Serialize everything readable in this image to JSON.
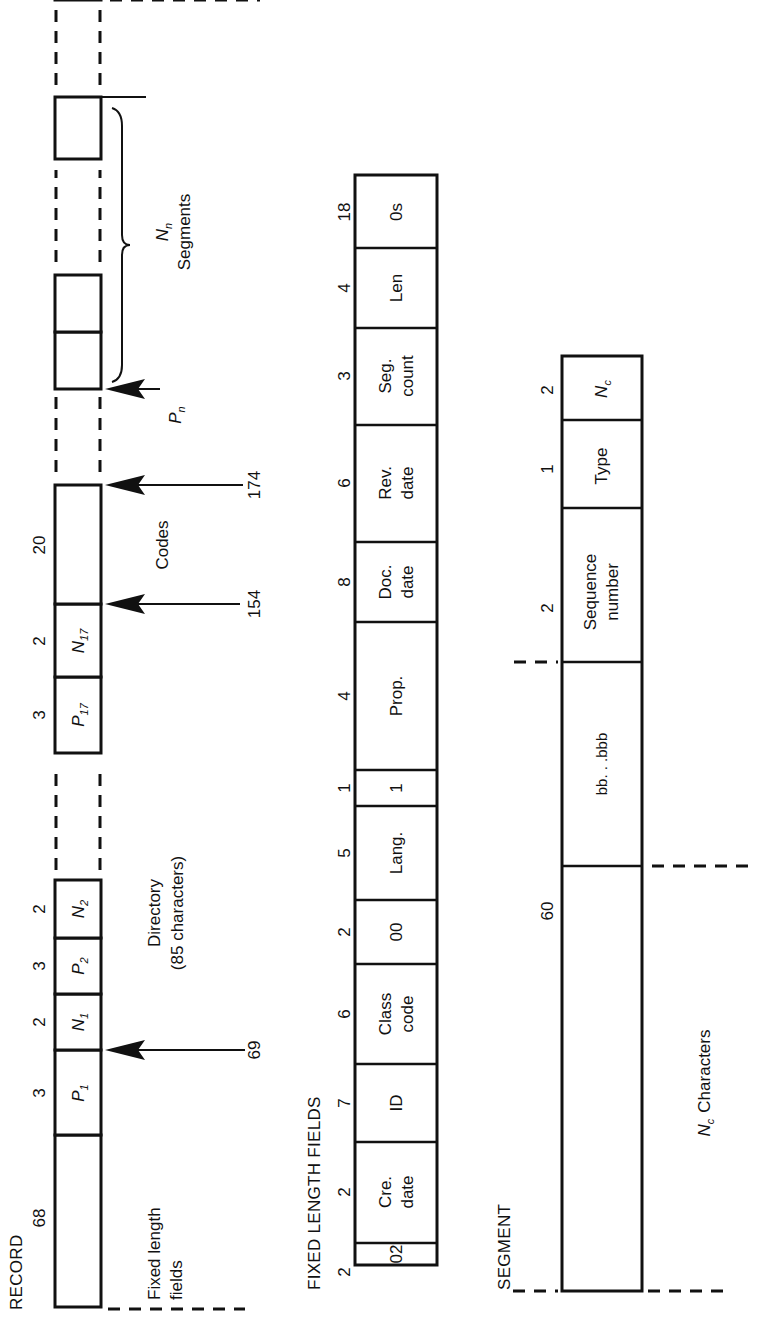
{
  "record": {
    "title": "RECORD",
    "fields": [
      {
        "width": "68",
        "label": ""
      },
      {
        "width": "3",
        "label": "P",
        "sub": "1"
      },
      {
        "width": "2",
        "label": "N",
        "sub": "1"
      },
      {
        "width": "3",
        "label": "P",
        "sub": "2"
      },
      {
        "width": "2",
        "label": "N",
        "sub": "2"
      },
      {
        "width": "3",
        "label": "P",
        "sub": "17"
      },
      {
        "width": "2",
        "label": "N",
        "sub": "17"
      },
      {
        "width": "20",
        "label": ""
      }
    ],
    "annotations": {
      "fixed_length_line1": "Fixed length",
      "fixed_length_line2": "fields",
      "directory_line1": "Directory",
      "directory_line2": "(85 characters)",
      "codes": "Codes",
      "segments_label": "N",
      "segments_sub": "n",
      "segments_word": "Segments",
      "pointer_label": "P",
      "pointer_sub": "n"
    },
    "arrows": [
      {
        "label": "69"
      },
      {
        "label": "154"
      },
      {
        "label": "174"
      }
    ]
  },
  "fixed_length_fields": {
    "title": "FIXED LENGTH FIELDS",
    "fields": [
      {
        "width": "2",
        "line1": "02",
        "line2": ""
      },
      {
        "width": "2",
        "line1": "Cre.",
        "line2": "date"
      },
      {
        "width": "7",
        "line1": "ID",
        "line2": ""
      },
      {
        "width": "6",
        "line1": "Class",
        "line2": "code"
      },
      {
        "width": "2",
        "line1": "00",
        "line2": ""
      },
      {
        "width": "5",
        "line1": "Lang.",
        "line2": ""
      },
      {
        "width": "1",
        "line1": "1",
        "line2": ""
      },
      {
        "width": "4",
        "line1": "Prop.",
        "line2": ""
      },
      {
        "width": "8",
        "line1": "Doc.",
        "line2": "date"
      },
      {
        "width": "6",
        "line1": "Rev.",
        "line2": "date"
      },
      {
        "width": "3",
        "line1": "Seg.",
        "line2": "count"
      },
      {
        "width": "4",
        "line1": "Len",
        "line2": ""
      },
      {
        "width": "18",
        "line1": "0s",
        "line2": ""
      }
    ]
  },
  "segment": {
    "title": "SEGMENT",
    "fields": [
      {
        "width": "60",
        "line1": "",
        "line2": ""
      },
      {
        "width": "",
        "line1": "bb. . .bbb",
        "line2": ""
      },
      {
        "width": "2",
        "line1": "Sequence",
        "line2": "number"
      },
      {
        "width": "1",
        "line1": "Type",
        "line2": ""
      },
      {
        "width": "2",
        "line1": "N",
        "sub": "c"
      }
    ],
    "nc_label": "N",
    "nc_sub": "c",
    "nc_word": "Characters"
  }
}
